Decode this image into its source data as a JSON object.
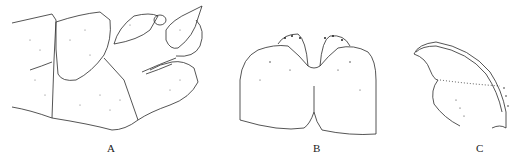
{
  "figure": {
    "panels": [
      {
        "id": "A",
        "label": "A",
        "description": "lateral view of abdominal terminalia"
      },
      {
        "id": "B",
        "label": "B",
        "description": "bilobed plate, dorsal view"
      },
      {
        "id": "C",
        "label": "C",
        "description": "curved sclerite, lateral view"
      }
    ]
  },
  "style": {
    "line_color": "#2a2a2a",
    "stipple_color": "#555555",
    "background": "#ffffff"
  }
}
